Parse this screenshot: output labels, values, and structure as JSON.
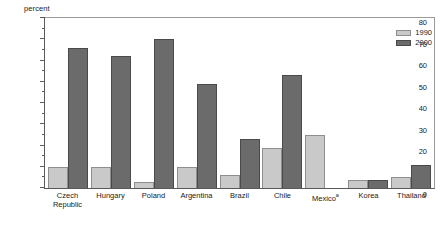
{
  "chart_data": {
    "type": "bar",
    "title": "",
    "subtitle": "",
    "xlabel": "",
    "ylabel": "percent",
    "ylim": [
      0,
      80
    ],
    "ytick_step": 10,
    "yminor_step": 5,
    "grid": false,
    "legend_position": "top-right",
    "categories": [
      "Czech Republic",
      "Hungary",
      "Poland",
      "Argentina",
      "Brazil",
      "Chile",
      "Mexico",
      "Korea",
      "Thailand"
    ],
    "category_lines": [
      [
        "Czech",
        "Republic"
      ],
      [
        "Hungary",
        ""
      ],
      [
        "Poland",
        ""
      ],
      [
        "Argentina",
        ""
      ],
      [
        "Brazil",
        ""
      ],
      [
        "Chile",
        ""
      ],
      [
        "Mexico",
        ""
      ],
      [
        "Korea",
        ""
      ],
      [
        "Thailand",
        ""
      ]
    ],
    "category_footnotes": [
      "",
      "",
      "",
      "",
      "",
      "",
      "a",
      "",
      ""
    ],
    "series": [
      {
        "name": "1990",
        "color": "#c9c9c9",
        "values": [
          10,
          10,
          3,
          10,
          6,
          19,
          25,
          4,
          5
        ]
      },
      {
        "name": "2000",
        "color": "#6b6b6b",
        "values": [
          66,
          62,
          70,
          49,
          23,
          53,
          null,
          4,
          11
        ]
      }
    ],
    "ytick_labels": [
      "0",
      "10",
      "20",
      "30",
      "40",
      "50",
      "60",
      "70",
      "80"
    ],
    "ytick_values": [
      0,
      10,
      20,
      30,
      40,
      50,
      60,
      70,
      80
    ],
    "yminor_values": [
      5,
      15,
      25,
      35,
      45,
      55,
      65,
      75
    ]
  },
  "legend": {
    "entries": [
      {
        "label": "1990",
        "color": "#c9c9c9"
      },
      {
        "label": "2000",
        "color": "#6b6b6b"
      }
    ]
  },
  "axis": {
    "unit_label": "percent"
  }
}
